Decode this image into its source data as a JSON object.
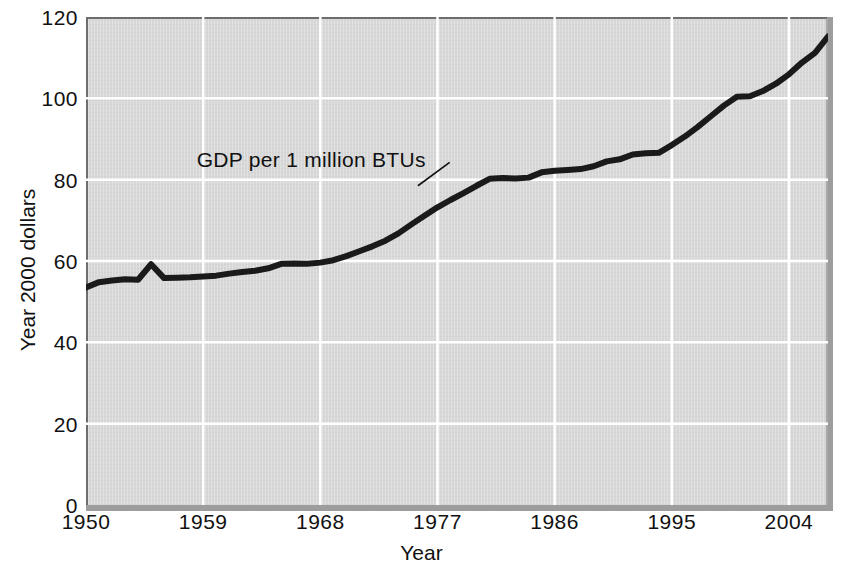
{
  "chart_data": {
    "type": "line",
    "title": "",
    "xlabel": "Year",
    "ylabel": "Year 2000 dollars",
    "xlim": [
      1950,
      2007
    ],
    "ylim": [
      0,
      120
    ],
    "xticks": [
      "1950",
      "1959",
      "1968",
      "1977",
      "1986",
      "1995",
      "2004"
    ],
    "xtick_values": [
      1950,
      1959,
      1968,
      1977,
      1986,
      1995,
      2004
    ],
    "yticks": [
      "0",
      "20",
      "40",
      "60",
      "80",
      "100",
      "120"
    ],
    "ytick_values": [
      0,
      20,
      40,
      60,
      80,
      100,
      120
    ],
    "grid": true,
    "grid_color": "#ffffff",
    "plot_background": "#d7d7d7",
    "line_color": "#1a1a1a",
    "line_width": 6,
    "legend": "none",
    "annotations": [
      {
        "text": "GDP per 1 million BTUs",
        "x": 1958.5,
        "y": 84.5,
        "leader_to_x": 1975.5,
        "leader_to_y": 78.5
      }
    ],
    "series": [
      {
        "name": "GDP per 1 million BTUs",
        "x": [
          1950,
          1951,
          1952,
          1953,
          1954,
          1955,
          1956,
          1957,
          1958,
          1959,
          1960,
          1961,
          1962,
          1963,
          1964,
          1965,
          1966,
          1967,
          1968,
          1969,
          1970,
          1971,
          1972,
          1973,
          1974,
          1975,
          1976,
          1977,
          1978,
          1979,
          1980,
          1981,
          1982,
          1983,
          1984,
          1985,
          1986,
          1987,
          1988,
          1989,
          1990,
          1991,
          1992,
          1993,
          1994,
          1995,
          1996,
          1997,
          1998,
          1999,
          2000,
          2001,
          2002,
          2003,
          2004,
          2005,
          2006,
          2007
        ],
        "y": [
          53.5,
          54.8,
          55.2,
          55.5,
          55.4,
          59.2,
          55.8,
          55.9,
          56.0,
          56.2,
          56.4,
          56.9,
          57.3,
          57.6,
          58.2,
          59.3,
          59.4,
          59.3,
          59.6,
          60.2,
          61.2,
          62.4,
          63.6,
          65.0,
          66.8,
          69.0,
          71.1,
          73.2,
          75.0,
          76.7,
          78.5,
          80.2,
          80.4,
          80.3,
          80.5,
          81.8,
          82.2,
          82.4,
          82.6,
          83.3,
          84.5,
          85.0,
          86.2,
          86.5,
          86.6,
          88.5,
          90.6,
          93.0,
          95.6,
          98.2,
          100.4,
          100.5,
          101.8,
          103.6,
          105.9,
          108.8,
          111.2,
          115.2
        ]
      }
    ]
  },
  "axes": {
    "y_title": "Year 2000 dollars",
    "x_title": "Year"
  }
}
